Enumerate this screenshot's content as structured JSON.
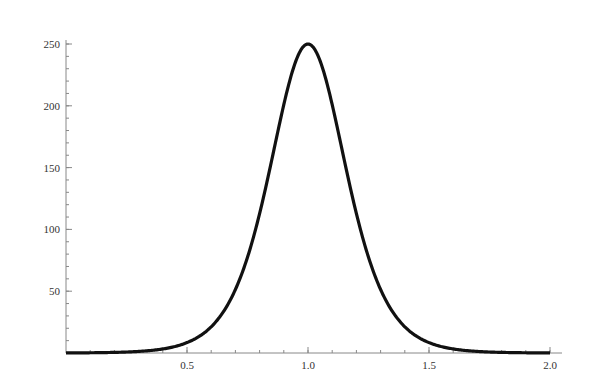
{
  "chart_data": {
    "type": "line",
    "title": "",
    "xlabel": "",
    "ylabel": "",
    "xlim": [
      0,
      2.05
    ],
    "ylim": [
      0,
      255
    ],
    "x_ticks": [
      0.5,
      1.0,
      1.5,
      2.0
    ],
    "x_tick_labels": [
      "0.5",
      "1.0",
      "1.5",
      "2.0"
    ],
    "x_minor_step": 0.1,
    "y_ticks": [
      50,
      100,
      150,
      200,
      250
    ],
    "y_tick_labels": [
      "50",
      "100",
      "150",
      "200",
      "250"
    ],
    "y_minor_step": 10,
    "grid": false,
    "legend": null,
    "series": [
      {
        "name": "curve",
        "color": "#111111",
        "x": [
          0.0,
          0.1,
          0.2,
          0.3,
          0.4,
          0.45,
          0.5,
          0.55,
          0.6,
          0.65,
          0.7,
          0.75,
          0.8,
          0.85,
          0.9,
          0.95,
          1.0,
          1.05,
          1.1,
          1.15,
          1.2,
          1.25,
          1.3,
          1.35,
          1.4,
          1.45,
          1.5,
          1.55,
          1.6,
          1.7,
          1.8,
          1.9,
          2.0
        ],
        "y": [
          0.1,
          0.2,
          0.5,
          1.3,
          3.3,
          5.3,
          8.4,
          13.4,
          21.1,
          33.4,
          51.4,
          77.6,
          112.8,
          155.8,
          200.9,
          236.3,
          250,
          236.3,
          200.9,
          155.8,
          112.8,
          77.6,
          51.4,
          33.4,
          21.1,
          13.4,
          8.4,
          5.3,
          3.3,
          1.3,
          0.5,
          0.2,
          0.1
        ]
      }
    ]
  }
}
